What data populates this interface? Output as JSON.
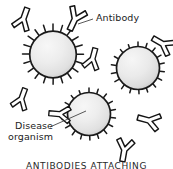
{
  "figure": {
    "type": "biology-illustration",
    "background_color": "#ffffff",
    "caption": "ANTIBODIES ATTACHING",
    "labels": {
      "antibody": "Antibody",
      "disease_line1": "Disease",
      "disease_line2": "organism"
    },
    "colors": {
      "ink": "#1b1b1b",
      "cell_fill_light": "#f2f2f2",
      "cell_fill_mid": "#e3e3e3",
      "cell_fill_dark": "#c9c9c9",
      "cell_outline": "#1a1a1a",
      "antibody_fill": "#ffffff",
      "antibody_outline": "#141414",
      "leader_line": "#3a3a3a"
    },
    "cells": [
      {
        "name": "disease-organism-top-left",
        "cx": 53,
        "cy": 55,
        "r": 24,
        "spikes": 20
      },
      {
        "name": "disease-organism-right",
        "cx": 138,
        "cy": 70,
        "r": 22,
        "spikes": 19
      },
      {
        "name": "disease-organism-bottom-center",
        "cx": 89,
        "cy": 116,
        "r": 22,
        "spikes": 19
      }
    ],
    "antibodies": [
      {
        "name": "antibody-free-top-left",
        "cx": 24,
        "cy": 17,
        "rotation": 200,
        "scale": 1.0,
        "attached": false
      },
      {
        "name": "antibody-attached-top-center",
        "cx": 74,
        "cy": 21,
        "rotation": 25,
        "scale": 1.05,
        "attached": true
      },
      {
        "name": "antibody-free-center",
        "cx": 93,
        "cy": 57,
        "rotation": 195,
        "scale": 0.95,
        "attached": false
      },
      {
        "name": "antibody-attached-right",
        "cx": 161,
        "cy": 43,
        "rotation": 120,
        "scale": 1.0,
        "attached": true
      },
      {
        "name": "antibody-free-left-lower",
        "cx": 22,
        "cy": 97,
        "rotation": 200,
        "scale": 0.95,
        "attached": false
      },
      {
        "name": "antibody-attached-bottom-left",
        "cx": 58,
        "cy": 114,
        "rotation": 95,
        "scale": 0.95,
        "attached": true
      },
      {
        "name": "antibody-free-bottom-right-upper",
        "cx": 147,
        "cy": 120,
        "rotation": 105,
        "scale": 1.0,
        "attached": false
      },
      {
        "name": "antibody-free-bottom-right-lower",
        "cx": 124,
        "cy": 152,
        "rotation": 10,
        "scale": 1.0,
        "attached": false
      }
    ],
    "leaders": [
      {
        "name": "leader-antibody",
        "x1": 93,
        "y1": 19,
        "x2": 78,
        "y2": 24
      },
      {
        "name": "leader-disease-organism",
        "x1": 50,
        "y1": 127,
        "x2": 86,
        "y2": 111
      }
    ]
  }
}
